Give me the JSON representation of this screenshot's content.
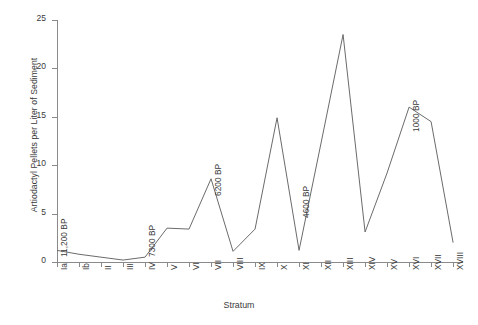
{
  "chart_data": {
    "type": "line",
    "title": "",
    "subtitle": "",
    "xlabel": "Stratum",
    "ylabel": "Artiodactyl Pellets per Liter of Sediment",
    "categories": [
      "Ia",
      "Ib",
      "II",
      "III",
      "IV",
      "V",
      "VI",
      "VII",
      "VIII",
      "IX",
      "X",
      "XI",
      "XII",
      "XIII",
      "XIV",
      "XV",
      "XVI",
      "XVII",
      "XVIII"
    ],
    "values": [
      1.2,
      0.8,
      0.5,
      0.2,
      0.5,
      3.5,
      3.4,
      8.6,
      1.1,
      3.4,
      14.9,
      1.2,
      12.3,
      23.5,
      3.1,
      9.2,
      16.0,
      14.5,
      2.0
    ],
    "ylim": [
      0,
      25
    ],
    "yticks": [
      0,
      5,
      10,
      15,
      20,
      25
    ],
    "grid": false,
    "legend": null,
    "line_color": "#6b6b6b",
    "annotations": [
      {
        "label": "11,200 BP",
        "category": "Ia"
      },
      {
        "label": "7300 BP",
        "category": "IV"
      },
      {
        "label": "6200 BP",
        "category": "VII"
      },
      {
        "label": "4600 BP",
        "category": "XI"
      },
      {
        "label": "1000 BP",
        "category": "XVI"
      }
    ]
  }
}
